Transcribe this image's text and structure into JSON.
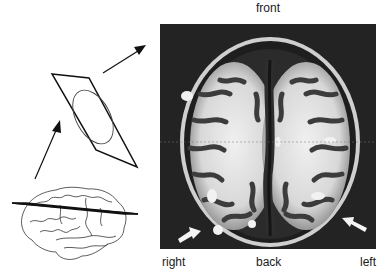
{
  "figure": {
    "labels": {
      "front": "front",
      "right": "right",
      "back": "back",
      "left": "left"
    },
    "colors": {
      "background": "#ffffff",
      "line": "#1a1a1a",
      "mri_background": "#1c1c1c",
      "mri_white_matter": "#e8e8e8",
      "mri_gray_matter": "#5a5a5a"
    }
  }
}
